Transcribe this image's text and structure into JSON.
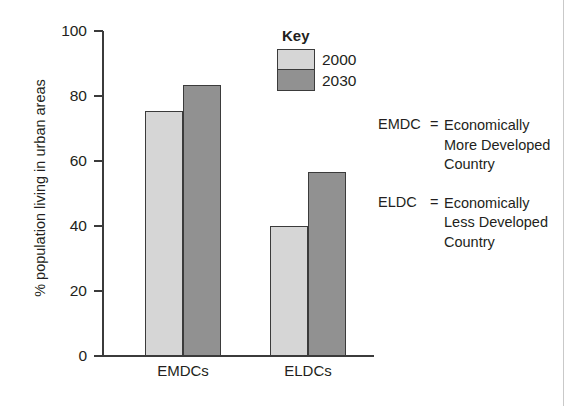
{
  "chart_data": {
    "type": "bar",
    "title": "",
    "xlabel": "",
    "ylabel": "% population living in urban areas",
    "ylim": [
      0,
      100
    ],
    "yticks": [
      0,
      20,
      40,
      60,
      80,
      100
    ],
    "ytick_labels": [
      "0",
      "20",
      "40",
      "60",
      "80",
      "100"
    ],
    "grid": false,
    "legend_position": "top-right",
    "legend_title": "Key",
    "categories": [
      "EMDCs",
      "ELDCs"
    ],
    "series": [
      {
        "name": "2000",
        "color": "#d6d6d6",
        "values": [
          75.5,
          40
        ]
      },
      {
        "name": "2030",
        "color": "#919191",
        "values": [
          83.5,
          56.5
        ]
      }
    ]
  },
  "key": {
    "title": "Key",
    "entries": [
      {
        "label": "2000",
        "swatch": "light"
      },
      {
        "label": "2030",
        "swatch": "dark"
      }
    ]
  },
  "definitions": [
    {
      "abbr": "EMDC",
      "eq": "=",
      "lines": [
        "Economically",
        "More Developed",
        "Country"
      ]
    },
    {
      "abbr": "ELDC",
      "eq": "=",
      "lines": [
        "Economically",
        "Less Developed",
        "Country"
      ]
    }
  ],
  "colors": {
    "series_2000": "#d6d6d6",
    "series_2030": "#919191",
    "axis": "#3b3b3b",
    "text": "#231f20",
    "background": "#ffffff"
  }
}
